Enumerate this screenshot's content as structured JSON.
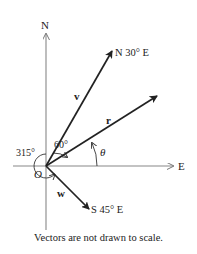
{
  "diagram": {
    "axes": {
      "north_label": "N",
      "east_label": "E",
      "origin_label": "O"
    },
    "vectors": [
      {
        "id": "v",
        "label": "v",
        "bearing_label": "N 30° E"
      },
      {
        "id": "r",
        "label": "r",
        "bearing_label": ""
      },
      {
        "id": "w",
        "label": "w",
        "bearing_label": "S 45° E"
      }
    ],
    "angles": {
      "between_v_and_r": "60°",
      "r_from_east": "θ",
      "w_around": "315°"
    },
    "colors": {
      "axis": "#888888",
      "vector": "#222222",
      "text": "#222222"
    }
  },
  "caption": "Vectors are not drawn to scale."
}
